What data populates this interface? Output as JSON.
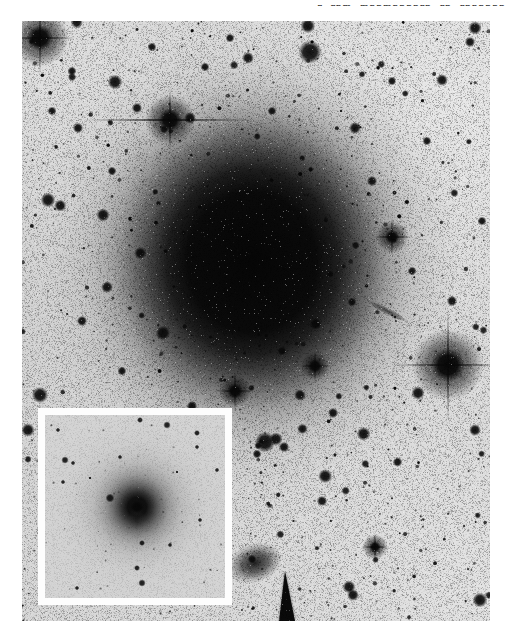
{
  "running_head": {
    "fragment": "r rnm mnnmnnnnrn rn rnnnnnn"
  },
  "photo": {
    "left": 22,
    "top": 21,
    "width": 468,
    "height": 600,
    "base_color": "#dadada",
    "shading": [
      {
        "x": 430,
        "y": 90,
        "r": 300,
        "rgb": "244,244,244",
        "a": 0.6
      },
      {
        "x": 460,
        "y": 560,
        "r": 260,
        "rgb": "238,238,238",
        "a": 0.5
      },
      {
        "x": 20,
        "y": 60,
        "r": 200,
        "rgb": "238,238,238",
        "a": 0.35
      },
      {
        "x": 40,
        "y": 330,
        "r": 300,
        "rgb": "186,186,186",
        "a": 0.15
      },
      {
        "x": 230,
        "y": 241,
        "r": 265,
        "rgb": "188,188,188",
        "a": 0.22
      }
    ],
    "galaxy": {
      "cx": 230,
      "cy": 241,
      "outer_r": 215,
      "squash_y": 1.08,
      "stops": [
        [
          0,
          "rgba(6,6,6,1)"
        ],
        [
          0.3,
          "rgba(10,10,10,1)"
        ],
        [
          0.4,
          "rgba(28,28,28,0.99)"
        ],
        [
          0.48,
          "rgba(62,62,62,0.95)"
        ],
        [
          0.56,
          "rgba(100,100,100,0.85)"
        ],
        [
          0.65,
          "rgba(138,138,138,0.62)"
        ],
        [
          0.76,
          "rgba(165,165,165,0.35)"
        ],
        [
          0.88,
          "rgba(185,185,185,0.15)"
        ],
        [
          1,
          "rgba(195,195,195,0)"
        ]
      ]
    },
    "features": {
      "plume_streak": {
        "x": 365,
        "y": 290,
        "len": 46,
        "w": 7,
        "angle": 27,
        "alpha": 0.72
      },
      "background_galaxy": {
        "x": 233,
        "y": 542,
        "rx": 20,
        "ry": 14,
        "angle": -18,
        "alpha": 0.92
      },
      "edge_on_wedge": {
        "points": [
          [
            257,
            600
          ],
          [
            273,
            600
          ],
          [
            263,
            550
          ]
        ],
        "alpha": 0.95
      }
    },
    "spiked_stars": [
      {
        "x": 18,
        "y": 17,
        "core": 10,
        "halo": 16,
        "h": 36,
        "v": 36,
        "d": 22
      },
      {
        "x": 148,
        "y": 99,
        "core": 9,
        "halo": 14,
        "h": 85,
        "v": 32,
        "d": 0
      },
      {
        "x": 426,
        "y": 344,
        "core": 13,
        "halo": 20,
        "h": 56,
        "v": 56,
        "d": 28
      },
      {
        "x": 370,
        "y": 216,
        "core": 5.5,
        "halo": 9,
        "h": 20,
        "v": 20,
        "d": 10
      },
      {
        "x": 353,
        "y": 526,
        "core": 4.5,
        "halo": 7,
        "h": 14,
        "v": 14,
        "d": 0
      },
      {
        "x": 213,
        "y": 370,
        "core": 6,
        "halo": 9,
        "h": 20,
        "v": 20,
        "d": 8
      },
      {
        "x": 293,
        "y": 345,
        "core": 5.5,
        "halo": 8,
        "h": 16,
        "v": 16,
        "d": 0
      }
    ],
    "blob_stars": [
      [
        288,
        31,
        8
      ],
      [
        81,
        194,
        4.5
      ],
      [
        56,
        107,
        3.5
      ],
      [
        226,
        37,
        4
      ],
      [
        333,
        107,
        4
      ],
      [
        396,
        372,
        4.5
      ],
      [
        18,
        374,
        5.5
      ],
      [
        6,
        409,
        4.5
      ],
      [
        85,
        266,
        4
      ],
      [
        141,
        312,
        5
      ],
      [
        243,
        421,
        7
      ],
      [
        254,
        418,
        4.5
      ],
      [
        262,
        426,
        3.5
      ],
      [
        235,
        433,
        3
      ],
      [
        278,
        374,
        4
      ],
      [
        311,
        392,
        3.5
      ],
      [
        331,
        574,
        4
      ],
      [
        458,
        579,
        5
      ],
      [
        453,
        7,
        4.5
      ],
      [
        453,
        409,
        4
      ],
      [
        93,
        61,
        5
      ],
      [
        130,
        26,
        3
      ],
      [
        208,
        17,
        3
      ],
      [
        183,
        46,
        3
      ],
      [
        115,
        87,
        3.5
      ],
      [
        168,
        97,
        4
      ],
      [
        26,
        179,
        5
      ],
      [
        330,
        281,
        3
      ],
      [
        420,
        59,
        4
      ],
      [
        448,
        21,
        3.5
      ],
      [
        350,
        160,
        3.5
      ],
      [
        60,
        300,
        3.5
      ],
      [
        100,
        350,
        3
      ],
      [
        170,
        385,
        3.5
      ],
      [
        205,
        445,
        3
      ],
      [
        300,
        480,
        3.5
      ],
      [
        260,
        330,
        3
      ],
      [
        390,
        250,
        3
      ],
      [
        430,
        280,
        3.5
      ],
      [
        460,
        200,
        3
      ],
      [
        405,
        120,
        3
      ],
      [
        370,
        60,
        3
      ],
      [
        250,
        90,
        3
      ],
      [
        50,
        50,
        3
      ],
      [
        30,
        90,
        3
      ],
      [
        90,
        150,
        3
      ]
    ],
    "star_field": {
      "seed": 20240917,
      "tiny": 800,
      "small": 170,
      "medium": 40,
      "large": 10
    },
    "grain": {
      "seed": 555,
      "dark_alpha": 0.35,
      "white_rate": 0.018,
      "white_alpha": 0.4
    }
  },
  "inset": {
    "left": 38,
    "top": 408,
    "outer_width": 194,
    "outer_height": 197,
    "border_width": 7,
    "border_color": "#fdfdfd",
    "inner_width": 180,
    "inner_height": 183,
    "background": "#d4d4d4",
    "galaxy": {
      "cx": 92,
      "cy": 92,
      "outer_r": 95,
      "stops": [
        [
          0,
          "rgba(12,12,12,1)"
        ],
        [
          0.1,
          "rgba(16,16,16,1)"
        ],
        [
          0.16,
          "rgba(40,40,40,0.95)"
        ],
        [
          0.24,
          "rgba(85,85,85,0.85)"
        ],
        [
          0.34,
          "rgba(125,125,125,0.65)"
        ],
        [
          0.48,
          "rgba(160,160,160,0.42)"
        ],
        [
          0.68,
          "rgba(185,185,185,0.20)"
        ],
        [
          1,
          "rgba(200,200,200,0)"
        ]
      ],
      "spike_v_len": 55,
      "spike_v_alpha": 0.12,
      "spike_h_len": 40,
      "spike_h_alpha": 0.08
    },
    "stars": [
      [
        95,
        5,
        2
      ],
      [
        122,
        10,
        2.5
      ],
      [
        152,
        18,
        2
      ],
      [
        20,
        45,
        2.5
      ],
      [
        28,
        48,
        1.5
      ],
      [
        75,
        42,
        1.5
      ],
      [
        18,
        67,
        1.5
      ],
      [
        45,
        63,
        1
      ],
      [
        65,
        83,
        3
      ],
      [
        132,
        57,
        1
      ],
      [
        152,
        32,
        1.5
      ],
      [
        97,
        128,
        2
      ],
      [
        92,
        153,
        2
      ],
      [
        97,
        168,
        2.5
      ],
      [
        32,
        173,
        1.5
      ],
      [
        172,
        55,
        1.5
      ],
      [
        13,
        15,
        1.5
      ],
      [
        155,
        105,
        1.5
      ],
      [
        125,
        130,
        1.5
      ]
    ],
    "star_field": {
      "seed": 909,
      "tiny": 60
    },
    "grain": {
      "seed": 777,
      "dark_alpha": 0.12,
      "white_rate": 0.004,
      "white_alpha": 0.2
    }
  }
}
